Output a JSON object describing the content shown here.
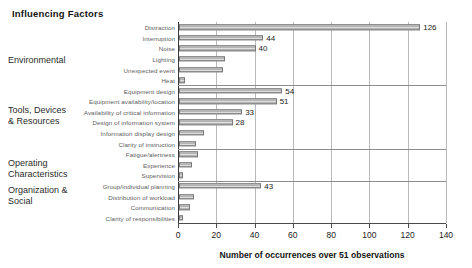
{
  "chart_title": "Influencing Factors",
  "groups": [
    {
      "name": "Environmental",
      "label": "Environmental"
    },
    {
      "name": "Tools, Devices & Resources",
      "label": "Tools, Devices\n& Resources"
    },
    {
      "name": "Operating Characteristics",
      "label": "Operating\nCharacteristics"
    },
    {
      "name": "Organization & Social",
      "label": "Organization &\nSocial"
    }
  ],
  "chart_data": {
    "type": "bar",
    "orientation": "horizontal",
    "title": "Influencing Factors",
    "xlabel": "Number of occurrences over 51 observations",
    "ylabel": "",
    "xlim": [
      0,
      140
    ],
    "xticks": [
      0,
      20,
      40,
      60,
      80,
      100,
      120,
      140
    ],
    "xtick_labels": [
      "0",
      "20",
      "40",
      "60",
      "80",
      "100",
      "120",
      "140"
    ],
    "grid": "vertical",
    "legend": "none",
    "categories": [
      "Distraction",
      "Interruption",
      "Noise",
      "Lighting",
      "Unexpected event",
      "Heat",
      "Equipment design",
      "Equipment availability/location",
      "Availability of critical information",
      "Design of information system",
      "Information display design",
      "Clarity of instruction",
      "Fatigue/alertness",
      "Experience",
      "Supervision",
      "Group/individual planning",
      "Distribution of workload",
      "Communication",
      "Clarity of responsibilities"
    ],
    "values": [
      126,
      44,
      40,
      24,
      23,
      3,
      54,
      51,
      33,
      28,
      13,
      9,
      10,
      7,
      2,
      43,
      8,
      6,
      2
    ],
    "data_labels": {
      "Distraction": "126",
      "Interruption": "44",
      "Noise": "40",
      "Equipment design": "54",
      "Equipment availability/location": "51",
      "Availability of critical information": "33",
      "Design of information system": "28",
      "Group/individual planning": "43"
    },
    "group_membership": [
      "Environmental",
      "Environmental",
      "Environmental",
      "Environmental",
      "Environmental",
      "Environmental",
      "Tools, Devices & Resources",
      "Tools, Devices & Resources",
      "Tools, Devices & Resources",
      "Tools, Devices & Resources",
      "Tools, Devices & Resources",
      "Tools, Devices & Resources",
      "Operating Characteristics",
      "Operating Characteristics",
      "Operating Characteristics",
      "Organization & Social",
      "Organization & Social",
      "Organization & Social",
      "Organization & Social"
    ]
  }
}
